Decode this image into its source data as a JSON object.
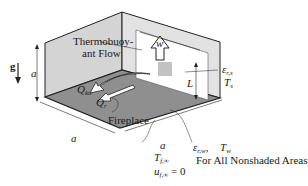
{
  "figure": {
    "gravity_label": "g",
    "labels": {
      "thermobuoyant_line1": "Thermobuoy-",
      "thermobuoyant_line2": "ant Flow",
      "width_symbol": "w",
      "height_symbol": "L",
      "room_height": "a",
      "room_width_front": "a",
      "room_depth_right": "a",
      "q_ku": "Q",
      "q_ku_sub": "ku",
      "q_r": "Q",
      "q_r_sub": "r",
      "fireplace": "Fireplace",
      "eps_fireplace": "ε",
      "eps_fireplace_sub": "r,s",
      "t_fireplace": "T",
      "t_fireplace_sub": "s",
      "eps_wall": "ε",
      "eps_wall_sub": "r,w",
      "t_wall": "T",
      "t_wall_sub": "w",
      "nonshaded_note": "For All Nonshaded Areas",
      "t_far": "T",
      "t_far_sub": "f,∞",
      "u_far": "u",
      "u_far_sub": "f,∞",
      "u_far_value": "= 0"
    },
    "colors": {
      "wall": "#d4d4d4",
      "floor": "#8f8f8f",
      "edge": "#222222",
      "fireplace_opening": "#ffffff"
    }
  }
}
